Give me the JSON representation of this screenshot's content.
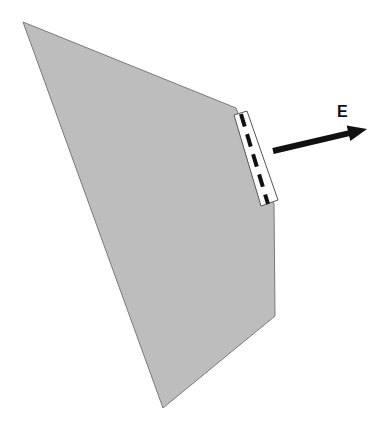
{
  "diagram": {
    "type": "geometric-field-diagram",
    "background": "#ffffff",
    "polygon": {
      "fill": "#bdbdbd",
      "stroke": "#7a7a7a",
      "points": [
        [
          23,
          22
        ],
        [
          236,
          108
        ],
        [
          274,
          204
        ],
        [
          275,
          316
        ],
        [
          163,
          408
        ]
      ]
    },
    "interface_strip": {
      "fill": "#ffffff",
      "stroke": "#555555",
      "points": [
        [
          234,
          115
        ],
        [
          247,
          111
        ],
        [
          278,
          200
        ],
        [
          261,
          206
        ]
      ],
      "dashed_line": {
        "from": [
          241,
          114
        ],
        "to": [
          268,
          204
        ],
        "color": "#111111",
        "dash": "13 8"
      }
    },
    "field_arrow": {
      "label": "E",
      "color": "#111111",
      "from": [
        273,
        151
      ],
      "to": [
        367,
        129
      ]
    }
  }
}
